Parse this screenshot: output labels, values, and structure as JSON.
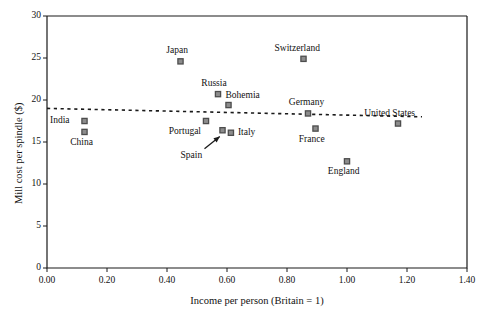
{
  "chart_data": {
    "type": "scatter",
    "title": "",
    "xlabel": "Income per person (Britain = 1)",
    "ylabel": "Mill cost per spindle ($)",
    "xlim": [
      0.0,
      1.4
    ],
    "ylim": [
      0,
      30
    ],
    "xticks": [
      "0.00",
      "0.20",
      "0.40",
      "0.60",
      "0.80",
      "1.00",
      "1.20",
      "1.40"
    ],
    "xtick_values": [
      0.0,
      0.2,
      0.4,
      0.6,
      0.8,
      1.0,
      1.2,
      1.4
    ],
    "yticks": [
      "0",
      "5",
      "10",
      "15",
      "20",
      "25",
      "30"
    ],
    "ytick_values": [
      0,
      5,
      10,
      15,
      20,
      25,
      30
    ],
    "grid": false,
    "legend": "none",
    "marker_style": "square-outline-gray",
    "marker_face_color": "#8c8c8c",
    "marker_edge_color": "#4d4d4d",
    "trendline": {
      "style": "dotted",
      "color": "#1a1a1a",
      "x_start": 0.0,
      "y_start": 19.0,
      "x_end": 1.25,
      "y_end": 18.0
    },
    "annotation_arrow": {
      "label": "Spain",
      "from_x": 0.525,
      "from_y": 14.2,
      "to_x": 0.585,
      "to_y": 15.9
    },
    "points": [
      {
        "label": "India",
        "x": 0.125,
        "y": 17.5,
        "label_pos": "left"
      },
      {
        "label": "China",
        "x": 0.125,
        "y": 16.2,
        "label_pos": "below"
      },
      {
        "label": "Japan",
        "x": 0.445,
        "y": 24.6,
        "label_pos": "above"
      },
      {
        "label": "Russia",
        "x": 0.57,
        "y": 20.7,
        "label_pos": "above"
      },
      {
        "label": "Bohemia",
        "x": 0.605,
        "y": 19.4,
        "label_pos": "right-above"
      },
      {
        "label": "Portugal",
        "x": 0.53,
        "y": 17.5,
        "label_pos": "below-left"
      },
      {
        "label": "Spain",
        "x": 0.585,
        "y": 16.4,
        "label_pos": "arrow"
      },
      {
        "label": "Italy",
        "x": 0.613,
        "y": 16.1,
        "label_pos": "right"
      },
      {
        "label": "Switzerland",
        "x": 0.855,
        "y": 24.9,
        "label_pos": "above"
      },
      {
        "label": "Germany",
        "x": 0.87,
        "y": 18.4,
        "label_pos": "above"
      },
      {
        "label": "France",
        "x": 0.895,
        "y": 16.6,
        "label_pos": "below"
      },
      {
        "label": "England",
        "x": 1.0,
        "y": 12.7,
        "label_pos": "below"
      },
      {
        "label": "United States",
        "x": 1.17,
        "y": 17.2,
        "label_pos": "above"
      }
    ]
  }
}
